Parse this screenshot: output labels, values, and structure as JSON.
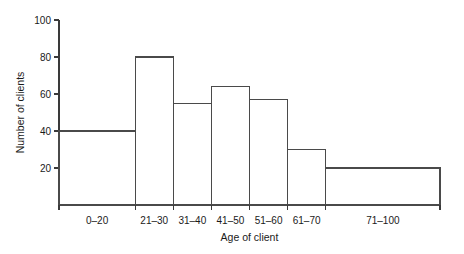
{
  "chart_data": {
    "type": "bar",
    "title": "",
    "xlabel": "Age of client",
    "ylabel": "Number of clients",
    "categories": [
      "0–20",
      "21–30",
      "31–40",
      "41–50",
      "51–60",
      "61–70",
      "71–100"
    ],
    "values": [
      40,
      80,
      55,
      64,
      57,
      30,
      20
    ],
    "bin_edges": [
      0,
      20,
      30,
      40,
      50,
      60,
      70,
      100
    ],
    "ylim": [
      0,
      100
    ],
    "ytick_labels": [
      "20",
      "40",
      "60",
      "80",
      "100"
    ],
    "ytick_values": [
      20,
      40,
      60,
      80,
      100
    ],
    "grid": false,
    "legend": false,
    "bar_fill": "#ffffff",
    "bar_stroke": "#4a4a4a",
    "axis_color": "#3a3a3a",
    "background": "#ffffff"
  }
}
